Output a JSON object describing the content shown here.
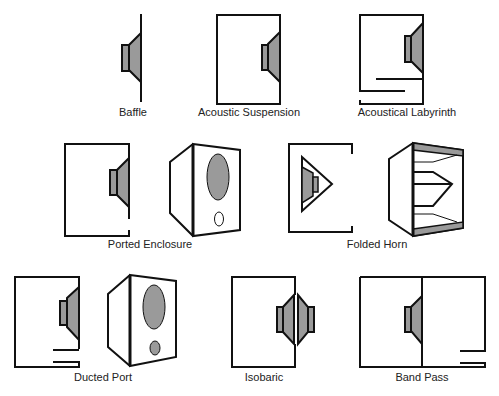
{
  "colors": {
    "line": "#111111",
    "fill": "#9a9a9a",
    "background": "#ffffff"
  },
  "enclosures": [
    {
      "id": "baffle",
      "label": "Baffle"
    },
    {
      "id": "acoustic-suspension",
      "label": "Acoustic Suspension"
    },
    {
      "id": "acoustical-labyrinth",
      "label": "Acoustical Labyrinth"
    },
    {
      "id": "ported-enclosure",
      "label": "Ported Enclosure"
    },
    {
      "id": "folded-horn",
      "label": "Folded Horn"
    },
    {
      "id": "ducted-port",
      "label": "Ducted Port"
    },
    {
      "id": "isobaric",
      "label": "Isobaric"
    },
    {
      "id": "band-pass",
      "label": "Band Pass"
    }
  ]
}
